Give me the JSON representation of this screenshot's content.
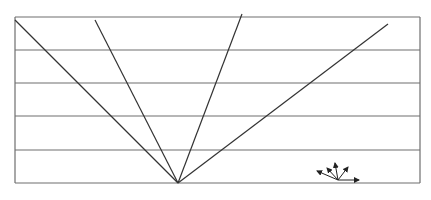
{
  "figure": {
    "caption": "",
    "colors": {
      "background": "#ffffff",
      "frame": "#6e6e6e",
      "rays": "#333333",
      "arrows": "#222222"
    },
    "frame": {
      "left": 15,
      "top": 17,
      "right": 420,
      "bottom": 183
    },
    "horizontal_lines_y": [
      17,
      50,
      83,
      116,
      150,
      183
    ],
    "origin": {
      "x": 178,
      "y": 183
    },
    "rays": [
      {
        "x": 15,
        "y": 20
      },
      {
        "x": 95,
        "y": 20
      },
      {
        "x": 242,
        "y": 14
      },
      {
        "x": 388,
        "y": 24
      }
    ],
    "arrow_icon": {
      "origin": {
        "x": 338,
        "y": 180
      },
      "tips": [
        {
          "x": 317,
          "y": 171
        },
        {
          "x": 327,
          "y": 168
        },
        {
          "x": 335,
          "y": 163
        },
        {
          "x": 348,
          "y": 167
        },
        {
          "x": 359,
          "y": 180
        }
      ]
    }
  }
}
